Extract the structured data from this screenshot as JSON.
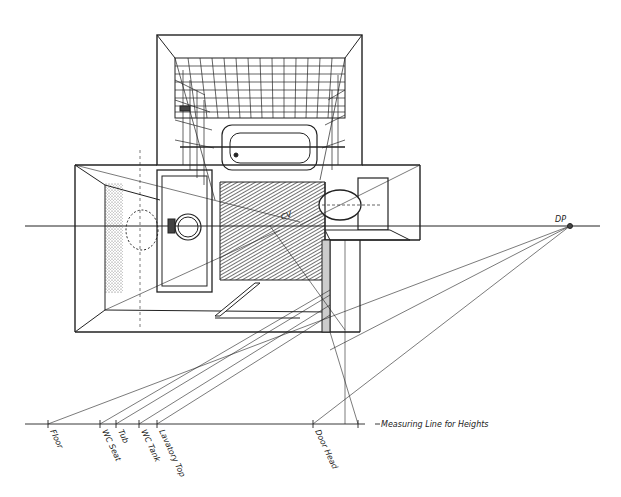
{
  "drawing": {
    "type": "one-point plan perspective of bathroom",
    "ink": "#222222",
    "paper": "#ffffff"
  },
  "labels": {
    "dp": "DP",
    "cv": "CV",
    "measuring_line": "Measuring Line for Heights"
  },
  "measuring_ticks": [
    {
      "label": "Floor",
      "x": 48
    },
    {
      "label": "WC Seat",
      "x": 100
    },
    {
      "label": "Tub",
      "x": 116
    },
    {
      "label": "WC Tank",
      "x": 139
    },
    {
      "label": "Lavatory Top",
      "x": 157
    },
    {
      "label": "Door Head",
      "x": 313
    }
  ]
}
